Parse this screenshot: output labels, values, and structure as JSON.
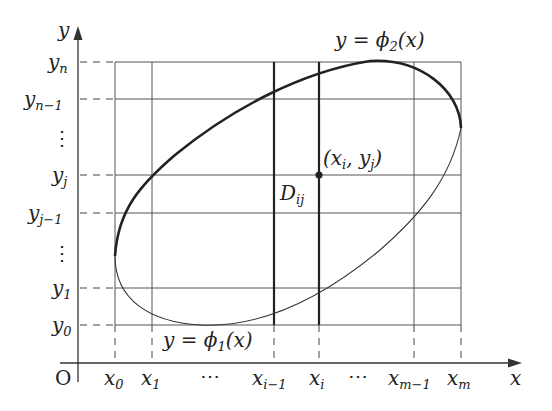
{
  "diagram": {
    "type": "double-integral-partition",
    "axes": {
      "x_label": "x",
      "y_label": "y",
      "origin_label": "O"
    },
    "x_ticks": [
      {
        "base": "x",
        "sub": "0"
      },
      {
        "base": "x",
        "sub": "1"
      },
      {
        "base": "⋯",
        "sub": ""
      },
      {
        "base": "x",
        "sub": "i−1"
      },
      {
        "base": "x",
        "sub": "i"
      },
      {
        "base": "⋯",
        "sub": ""
      },
      {
        "base": "x",
        "sub": "m−1"
      },
      {
        "base": "x",
        "sub": "m"
      }
    ],
    "y_ticks": [
      {
        "base": "y",
        "sub": "n"
      },
      {
        "base": "y",
        "sub": "n−1"
      },
      {
        "base": "⋮",
        "sub": ""
      },
      {
        "base": "y",
        "sub": "j"
      },
      {
        "base": "y",
        "sub": "j−1"
      },
      {
        "base": "⋮",
        "sub": ""
      },
      {
        "base": "y",
        "sub": "1"
      },
      {
        "base": "y",
        "sub": "0"
      }
    ],
    "curves": {
      "upper": {
        "label_pre": "y = ϕ",
        "sub": "2",
        "label_post": "(x)"
      },
      "lower": {
        "label_pre": "y = ϕ",
        "sub": "1",
        "label_post": "(x)"
      }
    },
    "point": {
      "label": "(x",
      "sub_i": "i",
      "mid": ", y",
      "sub_j": "j",
      "end": ")"
    },
    "region": {
      "base": "D",
      "sub": "ij"
    },
    "colors": {
      "line": "#333333",
      "curve": "#222222"
    }
  }
}
